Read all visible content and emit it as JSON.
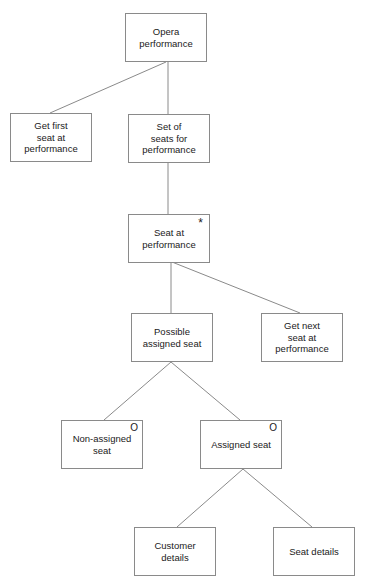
{
  "diagram": {
    "type": "tree",
    "nodes": [
      {
        "id": "opera",
        "label": "Opera\nperformance",
        "mark": ""
      },
      {
        "id": "get-first",
        "label": "Get first\nseat at\nperformance",
        "mark": ""
      },
      {
        "id": "set-of-seats",
        "label": "Set of\nseats for\nperformance",
        "mark": ""
      },
      {
        "id": "seat-at",
        "label": "Seat at\nperformance",
        "mark": "*"
      },
      {
        "id": "possible-assigned",
        "label": "Possible\nassigned seat",
        "mark": ""
      },
      {
        "id": "get-next",
        "label": "Get next\nseat at\nperformance",
        "mark": ""
      },
      {
        "id": "non-assigned",
        "label": "Non-assigned\nseat",
        "mark": "O"
      },
      {
        "id": "assigned",
        "label": "Assigned seat",
        "mark": "O"
      },
      {
        "id": "customer-details",
        "label": "Customer\ndetails",
        "mark": ""
      },
      {
        "id": "seat-details",
        "label": "Seat details",
        "mark": ""
      }
    ],
    "edges": [
      [
        "opera",
        "get-first"
      ],
      [
        "opera",
        "set-of-seats"
      ],
      [
        "set-of-seats",
        "seat-at"
      ],
      [
        "seat-at",
        "possible-assigned"
      ],
      [
        "seat-at",
        "get-next"
      ],
      [
        "possible-assigned",
        "non-assigned"
      ],
      [
        "possible-assigned",
        "assigned"
      ],
      [
        "assigned",
        "customer-details"
      ],
      [
        "assigned",
        "seat-details"
      ]
    ]
  }
}
